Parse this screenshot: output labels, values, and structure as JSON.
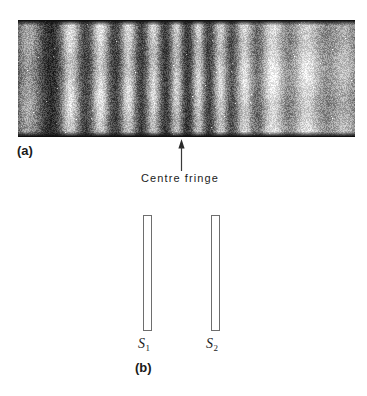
{
  "figure": {
    "type": "physics-figure"
  },
  "panel_a": {
    "label": "(a)",
    "photo": {
      "kind": "grainy-black-and-white-photograph",
      "content": "vertical interference fringes",
      "background_color": "#0d0d0d",
      "bright_color": "#f2f2f2",
      "grain": true
    },
    "annotation": {
      "arrow": "up-arrow",
      "caption": "Centre fringe"
    }
  },
  "panel_b": {
    "label": "(b)",
    "slits": [
      {
        "name": "S",
        "subscript": "1"
      },
      {
        "name": "S",
        "subscript": "2"
      }
    ],
    "outline_color": "#6e6e6e",
    "fill_color": "#ffffff"
  },
  "chart_data": {
    "type": "line",
    "xlabel": "Position across screen (px)",
    "ylabel": "Relative intensity",
    "xlim": [
      0,
      337
    ],
    "ylim": [
      0,
      1
    ],
    "grid": false,
    "bright_fringe_centres": [
      10,
      52,
      82,
      110,
      135,
      158,
      180,
      202,
      226,
      254,
      288,
      326
    ],
    "bright_fringe_intensity": [
      0.62,
      0.88,
      0.9,
      0.86,
      0.84,
      0.8,
      0.82,
      0.84,
      0.88,
      0.95,
      0.9,
      0.72
    ],
    "bright_fringe_width": [
      16,
      12,
      11,
      10,
      9,
      8,
      8,
      9,
      11,
      15,
      20,
      22
    ],
    "centre_fringe_index": 6,
    "dark_level": 0.06
  }
}
